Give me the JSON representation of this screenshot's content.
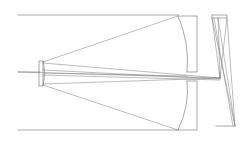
{
  "diagram": {
    "stroke_color": "#6e6e6e",
    "ray_color": "#7a7a7a",
    "elements": {
      "top_boundary": {
        "x1": 18,
        "y1": 15,
        "x2": 178,
        "y2": 15
      },
      "bottom_boundary": {
        "x1": 18,
        "y1": 130,
        "x2": 178,
        "y2": 130
      },
      "optical_axis": {
        "x1": 18,
        "y1": 72,
        "x2": 178,
        "y2": 72
      }
    }
  }
}
